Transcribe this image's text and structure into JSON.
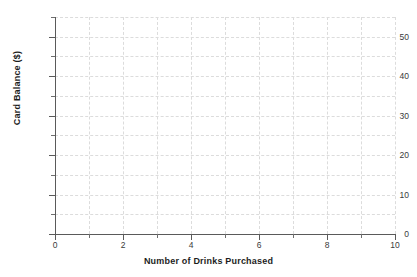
{
  "chart_data": {
    "type": "scatter",
    "title": "",
    "subtitle": "",
    "xlabel": "Number of Drinks Purchased",
    "ylabel": "Card Balance ($)",
    "xlim": [
      0,
      10
    ],
    "ylim": [
      0,
      55
    ],
    "x_ticks": [
      0,
      2,
      4,
      6,
      8,
      10
    ],
    "x_tick_labels": [
      "0",
      "2",
      "4",
      "6",
      "8",
      "10"
    ],
    "x_minor_ticks": [
      1,
      3,
      5,
      7,
      9
    ],
    "y_ticks": [
      0,
      10,
      20,
      30,
      40,
      50
    ],
    "y_tick_labels": [
      "0",
      "10",
      "20",
      "30",
      "40",
      "50"
    ],
    "y_minor_ticks": [
      5,
      15,
      25,
      35,
      45,
      55
    ],
    "grid": true,
    "grid_style": "dashed",
    "grid_color": "#dcdcdc",
    "legend": false,
    "legend_position": "none",
    "series": [],
    "values": [],
    "annotations": [],
    "note": "Empty plot: axes and gridlines drawn, no data plotted"
  },
  "colors": {
    "background": "#ffffff",
    "axis": "#5a5a5a",
    "grid": "#dcdcdc",
    "tick_label": "#3a3a3a",
    "axis_title": "#1d1d1d"
  }
}
